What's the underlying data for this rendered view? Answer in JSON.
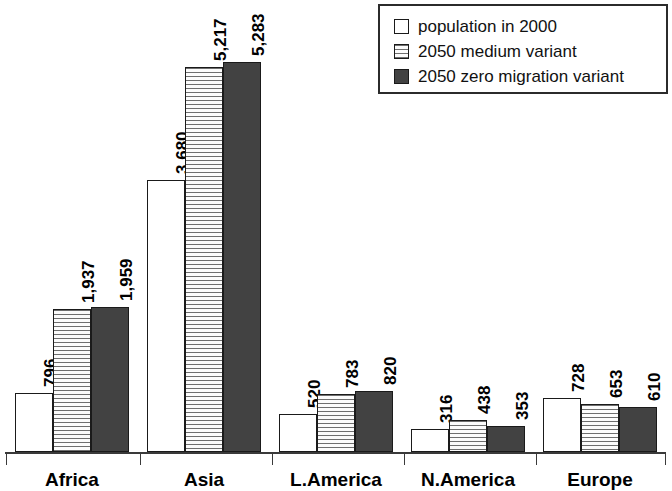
{
  "chart_data": {
    "type": "bar",
    "title": "",
    "subtitle": "",
    "xlabel": "",
    "ylabel": "",
    "grid": false,
    "legend_position": "top-right",
    "categories": [
      "Africa",
      "Asia",
      "L.America",
      "N.America",
      "Europe"
    ],
    "ylim": [
      0,
      5283
    ],
    "axis_visible": {
      "x": true,
      "y": false
    },
    "series": [
      {
        "name": "population in 2000",
        "style": "open",
        "color": "#ffffff",
        "values": [
          796,
          3680,
          520,
          316,
          728
        ],
        "labels": [
          "796",
          "3,680",
          "520",
          "316",
          "728"
        ]
      },
      {
        "name": "2050 medium variant",
        "style": "horizontal-hatch",
        "color": "#f2f2f2",
        "values": [
          1937,
          5217,
          783,
          438,
          653
        ],
        "labels": [
          "1,937",
          "5,217",
          "783",
          "438",
          "653"
        ]
      },
      {
        "name": "2050 zero migration variant",
        "style": "solid-dark",
        "color": "#424242",
        "values": [
          1959,
          5283,
          820,
          353,
          610
        ],
        "labels": [
          "1,959",
          "5,283",
          "820",
          "353",
          "610"
        ]
      }
    ]
  },
  "legend": {
    "items": [
      {
        "label": "population in 2000",
        "swatch": "open-square-icon"
      },
      {
        "label": "2050 medium variant",
        "swatch": "hatched-square-icon"
      },
      {
        "label": "2050 zero migration variant",
        "swatch": "dark-square-icon"
      }
    ]
  },
  "axis": {
    "categories": [
      "Africa",
      "Asia",
      "L.America",
      "N.America",
      "Europe"
    ]
  }
}
